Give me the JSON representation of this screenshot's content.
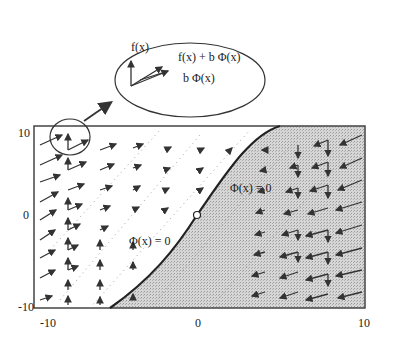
{
  "figure": {
    "type": "vector-field-diagram",
    "axes": {
      "x_ticks": [
        "-10",
        "0",
        "10"
      ],
      "y_ticks": [
        "10",
        "0",
        "-10"
      ],
      "xlim": [
        -10,
        10
      ],
      "ylim": [
        -10,
        10
      ]
    },
    "callout": {
      "labels": {
        "f": "f(x)",
        "sum": "f(x) + b Φ(x)",
        "b_phi": "b Φ(x)"
      }
    },
    "curve_labels": {
      "upper": "Φ(x) = 0",
      "lower": "Φ(x) = 0"
    },
    "colors": {
      "frame": "#444444",
      "shaded_region": "#cfcfcf",
      "arrows": "#333333",
      "curve": "#222222"
    }
  }
}
